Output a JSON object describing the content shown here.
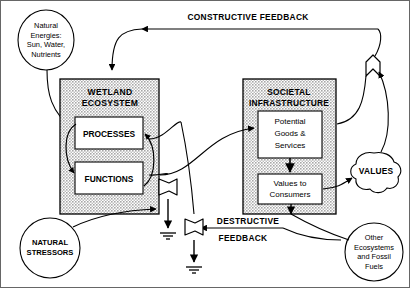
{
  "diagram": {
    "frame_color": "#555555",
    "line_color": "#000000",
    "box_fill": "#c9c9c9",
    "inner_box_fill": "#ffffff",
    "source_ellipse_natural_energies": {
      "lines": [
        "Natural",
        "Energies:",
        "Sun, Water,",
        "Nutrients"
      ]
    },
    "source_circle_natural_stressors": {
      "lines": [
        "NATURAL",
        "STRESSORS"
      ]
    },
    "source_circle_other_ecosystems": {
      "lines": [
        "Other",
        "Ecosystems",
        "and Fossil",
        "Fuels"
      ]
    },
    "wetland_box": {
      "title_lines": [
        "WETLAND",
        "ECOSYSTEM"
      ],
      "sub_boxes": [
        {
          "label": "PROCESSES"
        },
        {
          "label": "FUNCTIONS"
        }
      ]
    },
    "societal_box": {
      "title_lines": [
        "SOCIETAL",
        "INFRASTRUCTURE"
      ],
      "sub_boxes": [
        {
          "lines": [
            "Potential",
            "Goods &",
            "Services"
          ]
        },
        {
          "lines": [
            "Values to",
            "Consumers"
          ]
        }
      ]
    },
    "values_cloud": {
      "label": "VALUES"
    },
    "feedback_labels": {
      "constructive": "CONSTRUCTIVE FEEDBACK",
      "destructive_line1": "DESTRUCTIVE",
      "destructive_line2": "FEEDBACK"
    },
    "symbols": {
      "interaction": "interaction-symbol",
      "heat_sink_left": "heat-sink-symbol",
      "heat_sink_right": "heat-sink-symbol",
      "ground_left": "ground-symbol",
      "ground_right": "ground-symbol"
    }
  }
}
